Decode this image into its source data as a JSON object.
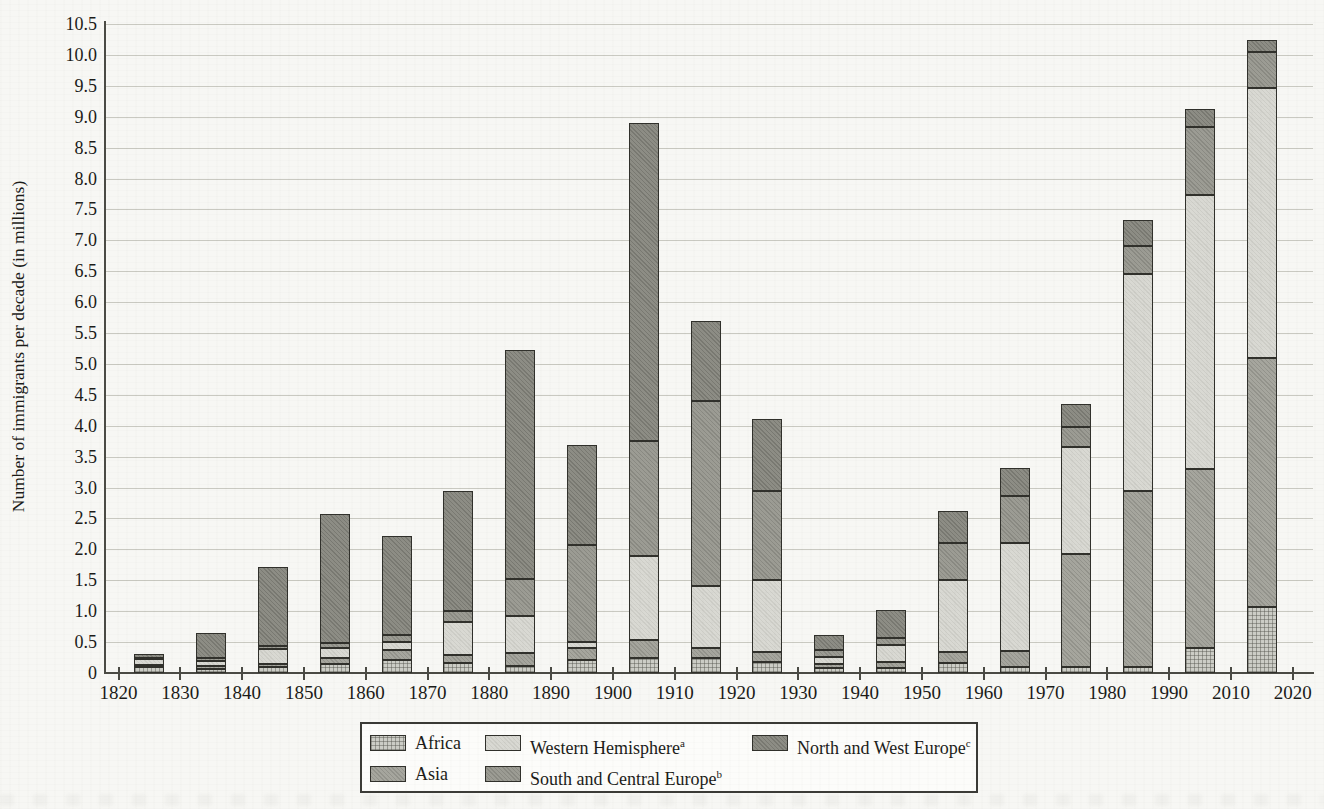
{
  "chart_data": {
    "type": "bar",
    "stacked": true,
    "title": "",
    "xlabel": "",
    "ylabel": "Number of immigrants per decade (in millions)",
    "ylim": [
      0,
      10.5
    ],
    "ytick_step": 0.5,
    "ytick_labels": [
      "10.5",
      "10.0",
      "9.5",
      "9.0",
      "8.5",
      "8.0",
      "7.5",
      "7.0",
      "6.5",
      "6.0",
      "5.5",
      "5.0",
      "4.5",
      "4.0",
      "3.5",
      "3.0",
      "2.5",
      "2.0",
      "1.5",
      "1.0",
      "0.5",
      "0"
    ],
    "xtick_labels": [
      "1820",
      "1830",
      "1840",
      "1850",
      "1860",
      "1870",
      "1880",
      "1890",
      "1900",
      "1910",
      "1920",
      "1930",
      "1940",
      "1950",
      "1960",
      "1970",
      "1980",
      "1990",
      "2010",
      "2020"
    ],
    "bars_span_between_ticks": true,
    "grid": true,
    "legend_position": "bottom",
    "series": [
      {
        "name": "Africa",
        "footnote": "",
        "color": "#cccdc6",
        "pattern": "crosshatch",
        "values": [
          0.1,
          0.06,
          0.1,
          0.15,
          0.21,
          0.16,
          0.11,
          0.21,
          0.25,
          0.25,
          0.18,
          0.08,
          0.08,
          0.16,
          0.1,
          0.1,
          0.1,
          0.41,
          1.07
        ]
      },
      {
        "name": "Asia",
        "footnote": "",
        "color": "#a6a69e",
        "pattern": "fine-dots",
        "values": [
          0.03,
          0.05,
          0.05,
          0.1,
          0.16,
          0.13,
          0.21,
          0.19,
          0.28,
          0.16,
          0.16,
          0.07,
          0.1,
          0.18,
          0.25,
          1.82,
          2.84,
          2.89,
          4.03
        ]
      },
      {
        "name": "Western Hemisphere",
        "footnote": "a",
        "color": "#d9d9d3",
        "pattern": "light",
        "values": [
          0.09,
          0.08,
          0.24,
          0.15,
          0.13,
          0.53,
          0.61,
          0.1,
          1.37,
          0.99,
          1.17,
          0.11,
          0.27,
          1.17,
          1.75,
          1.73,
          3.52,
          4.44,
          4.37
        ]
      },
      {
        "name": "South and Central Europe",
        "footnote": "b",
        "color": "#9c9c94",
        "pattern": "fine-dots",
        "values": [
          0.03,
          0.06,
          0.05,
          0.08,
          0.11,
          0.19,
          0.59,
          1.57,
          1.85,
          3.0,
          1.44,
          0.11,
          0.12,
          0.59,
          0.77,
          0.33,
          0.45,
          1.1,
          0.57
        ]
      },
      {
        "name": "North and West Europe",
        "footnote": "c",
        "color": "#8d8d85",
        "pattern": "dark-dots",
        "values": [
          0.05,
          0.4,
          1.28,
          2.09,
          1.61,
          1.94,
          3.7,
          1.62,
          5.15,
          1.3,
          1.16,
          0.24,
          0.45,
          0.52,
          0.45,
          0.37,
          0.42,
          0.29,
          0.2
        ]
      }
    ],
    "bar_totals": [
      0.3,
      0.65,
      1.72,
      2.57,
      2.22,
      2.95,
      5.22,
      3.69,
      8.9,
      5.7,
      4.11,
      0.61,
      1.02,
      2.62,
      3.32,
      4.35,
      7.33,
      9.13,
      10.24
    ]
  }
}
